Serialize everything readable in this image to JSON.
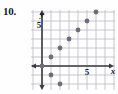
{
  "problem": {
    "number_label": "10."
  },
  "graph": {
    "x_axis_label": "x",
    "y_axis_label": "y",
    "x_tick_label": "5",
    "y_tick_label": "5",
    "grid_color": "#b9b9c4",
    "axis_color": "#3a3a42",
    "point_color": "#6e6e7a",
    "background_color": "#fefefe"
  },
  "chart_data": {
    "type": "scatter",
    "title": "",
    "xlabel": "x",
    "ylabel": "y",
    "xlim": [
      -2,
      7
    ],
    "ylim": [
      -3,
      7
    ],
    "xticks": [
      5
    ],
    "yticks": [
      5
    ],
    "grid": true,
    "legend": false,
    "points": [
      {
        "x": 0,
        "y": 0
      },
      {
        "x": 1,
        "y": -1
      },
      {
        "x": 2,
        "y": -2
      },
      {
        "x": 1,
        "y": 1
      },
      {
        "x": 2,
        "y": 2
      },
      {
        "x": 3,
        "y": 3
      },
      {
        "x": 4,
        "y": 4
      },
      {
        "x": 5,
        "y": 5
      },
      {
        "x": 6,
        "y": 6
      }
    ],
    "x_values": [
      0,
      1,
      2,
      1,
      2,
      3,
      4,
      5,
      6
    ],
    "y_values": [
      0,
      -1,
      -2,
      1,
      2,
      3,
      4,
      5,
      6
    ]
  }
}
